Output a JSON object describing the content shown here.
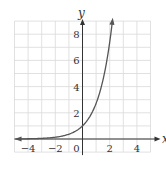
{
  "chart_data": {
    "type": "line",
    "title": "",
    "function": "y = e^x",
    "xlabel": "x",
    "ylabel": "y",
    "xlim": [
      -5,
      5
    ],
    "ylim": [
      -1,
      9
    ],
    "grid": true,
    "x_ticks": [
      -4,
      -2,
      0,
      2,
      4
    ],
    "x_tick_labels": [
      "−4",
      "−2",
      "0",
      "2",
      "4"
    ],
    "y_ticks": [
      2,
      4,
      6,
      8
    ],
    "y_tick_labels": [
      "2",
      "4",
      "6",
      "8"
    ],
    "series": [
      {
        "name": "exponential curve",
        "x": [
          -5,
          -4,
          -3,
          -2,
          -1,
          0,
          0.5,
          1,
          1.5,
          2,
          2.2
        ],
        "y": [
          0.007,
          0.018,
          0.05,
          0.135,
          0.368,
          1,
          1.649,
          2.718,
          4.482,
          7.389,
          9.025
        ]
      }
    ],
    "colors": {
      "grid": "#d9d9d9",
      "axis": "#333333",
      "curve": "#555555",
      "text": "#333333"
    }
  }
}
